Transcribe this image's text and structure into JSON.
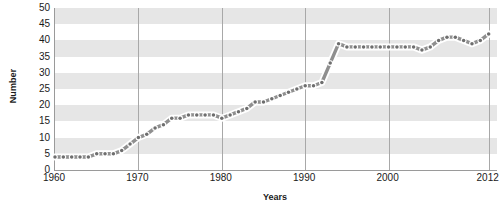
{
  "chart_data": {
    "type": "line",
    "title": "",
    "subtitle": "",
    "xlabel": "Years",
    "ylabel": "Number",
    "xlim": [
      1960,
      2013
    ],
    "ylim": [
      0,
      50
    ],
    "grid": "horizontal-bands-and-vertical-gridlines",
    "legend": "none",
    "y_ticks": [
      0,
      5,
      10,
      15,
      20,
      25,
      30,
      35,
      40,
      45,
      50
    ],
    "x_ticks": [
      1960,
      1970,
      1980,
      1990,
      2000,
      2012
    ],
    "x_tick_labels": [
      "1960",
      "1970",
      "1980",
      "1990",
      "2000",
      "2012"
    ],
    "series": [
      {
        "name": "Number",
        "line_color": "#8f8f8f",
        "marker_color": "#6e6e6e",
        "x": [
          1960,
          1961,
          1962,
          1963,
          1964,
          1965,
          1966,
          1967,
          1968,
          1969,
          1970,
          1971,
          1972,
          1973,
          1974,
          1975,
          1976,
          1977,
          1978,
          1979,
          1980,
          1981,
          1982,
          1983,
          1984,
          1985,
          1986,
          1987,
          1988,
          1989,
          1990,
          1991,
          1992,
          1993,
          1994,
          1995,
          1996,
          1997,
          1998,
          1999,
          2000,
          2001,
          2002,
          2003,
          2004,
          2005,
          2006,
          2007,
          2008,
          2009,
          2010,
          2011,
          2012
        ],
        "values": [
          4,
          4,
          4,
          4,
          4,
          5,
          5,
          5,
          6,
          8,
          10,
          11,
          13,
          14,
          16,
          16,
          17,
          17,
          17,
          17,
          16,
          17,
          18,
          19,
          21,
          21,
          22,
          23,
          24,
          25,
          26,
          26,
          27,
          33,
          39,
          38,
          38,
          38,
          38,
          38,
          38,
          38,
          38,
          38,
          37,
          38,
          40,
          41,
          41,
          40,
          39,
          40,
          42
        ]
      }
    ]
  },
  "axes": {
    "y_title": "Number",
    "x_title": "Years"
  },
  "colors": {
    "band": "#e6e6e6",
    "gridline": "#a8a8a8",
    "axis": "#9a9a9a",
    "line": "#8f8f8f",
    "marker": "#6e6e6e",
    "marker_halo": "#ffffff",
    "text": "#1a1a1a",
    "background": "#ffffff"
  }
}
